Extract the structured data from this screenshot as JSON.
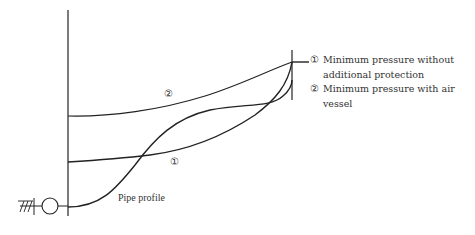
{
  "diagram": {
    "labels": {
      "curve1_marker": "①",
      "curve2_marker": "②",
      "pipe_profile": "Pipe profile"
    },
    "legend": [
      {
        "marker": "①",
        "text": "Minimum pressure without additional protection"
      },
      {
        "marker": "②",
        "text": "Minimum pressure with air vessel"
      }
    ],
    "colors": {
      "line": "#222222",
      "text": "#333333"
    }
  }
}
